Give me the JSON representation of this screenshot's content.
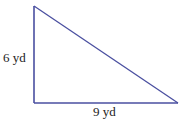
{
  "diagram": {
    "type": "right-triangle",
    "stroke_color": "#4a4fa0",
    "background": "#ffffff",
    "vertices": {
      "top": [
        34,
        6
      ],
      "right_angle": [
        34,
        103
      ],
      "right": [
        178,
        103
      ]
    },
    "labels": {
      "height": "6 yd",
      "base": "9 yd"
    },
    "dimensions": {
      "height_value": 6,
      "base_value": 9,
      "unit": "yd"
    }
  }
}
